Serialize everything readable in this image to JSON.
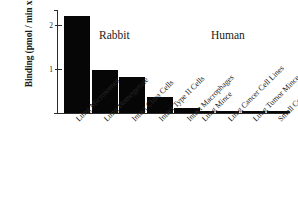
{
  "chart_data": {
    "type": "bar",
    "title": "",
    "xlabel": "",
    "ylabel": "Binding (pmol / min x mg)",
    "ylim": [
      0,
      2.35
    ],
    "yticks": [
      1,
      2
    ],
    "ytick_labels": [
      "1",
      "2"
    ],
    "grid": false,
    "legend": "none",
    "group_labels": [
      "Rabbit",
      "Human"
    ],
    "groups": [
      {
        "name": "Rabbit",
        "categories": [
          "Lung Microsomes",
          "Lung Homogenate",
          "Intact Clara Cells",
          "Intact Type II Cells",
          "Intact Macrophages"
        ],
        "values": [
          2.2,
          0.98,
          0.82,
          0.36,
          0.11
        ]
      },
      {
        "name": "Human",
        "categories": [
          "Lung Mince",
          "Lung Cancer Cell Lines",
          "Lung Tumor Mince",
          "Small Cell Carcinoma"
        ],
        "values": [
          0.04,
          0.04,
          0.04,
          0.03
        ]
      }
    ],
    "categories": [
      "Lung Microsomes",
      "Lung Homogenate",
      "Intact Clara Cells",
      "Intact Type II Cells",
      "Intact Macrophages",
      "Lung Mince",
      "Lung Cancer Cell Lines",
      "Lung Tumor Mince",
      "Small Cell Carcinoma"
    ],
    "values": [
      2.2,
      0.98,
      0.82,
      0.36,
      0.11,
      0.04,
      0.04,
      0.04,
      0.03
    ],
    "bar_color": "#060606",
    "axis_color": "#2b2b2b",
    "background": "#ffffff"
  }
}
